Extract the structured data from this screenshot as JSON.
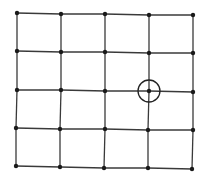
{
  "diagram": {
    "type": "grid-graph",
    "rows": 5,
    "cols": 5,
    "line_color": "#3a3a3a",
    "node_color": "#1a1a1a",
    "highlight_color": "#222222",
    "nodes": [
      [
        [
          17,
          13
        ],
        [
          61,
          14
        ],
        [
          105,
          14
        ],
        [
          149,
          15
        ],
        [
          193,
          15
        ]
      ],
      [
        [
          17,
          51
        ],
        [
          61,
          52
        ],
        [
          105,
          52
        ],
        [
          149,
          53
        ],
        [
          193,
          53
        ]
      ],
      [
        [
          17,
          90
        ],
        [
          61,
          90
        ],
        [
          105,
          91
        ],
        [
          149,
          91
        ],
        [
          193,
          92
        ]
      ],
      [
        [
          16,
          128
        ],
        [
          60,
          129
        ],
        [
          105,
          129
        ],
        [
          148,
          130
        ],
        [
          193,
          130
        ]
      ],
      [
        [
          16,
          166
        ],
        [
          60,
          167
        ],
        [
          104,
          168
        ],
        [
          148,
          168
        ],
        [
          192,
          169
        ]
      ]
    ],
    "highlighted_node": {
      "row": 2,
      "col": 3,
      "circle_radius": 11
    }
  }
}
